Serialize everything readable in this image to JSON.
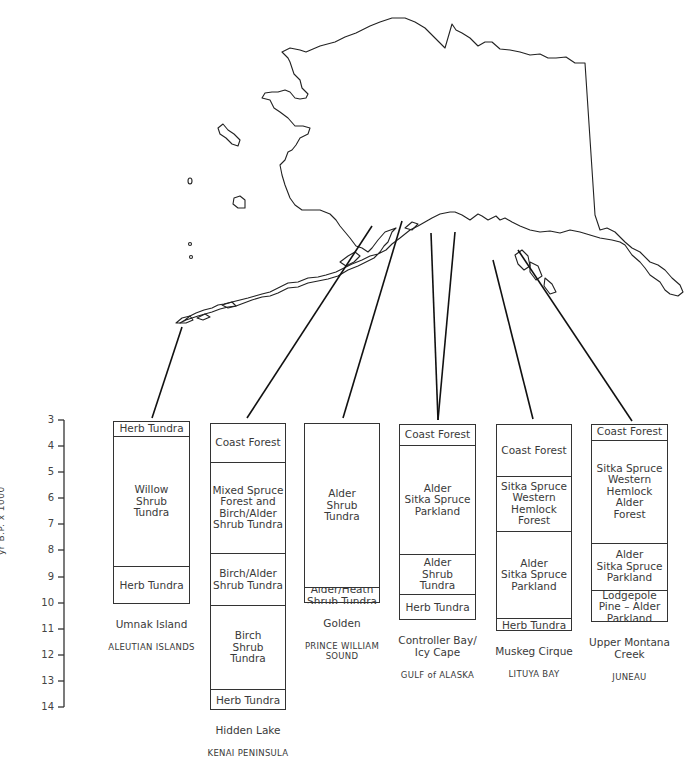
{
  "figure": {
    "type": "vegetation-history-diagram",
    "map_subject": "Alaska outline with lines linking core sites to pollen-zone columns"
  },
  "axis": {
    "label": "yr B.P. x 1000",
    "ticks": [
      "3",
      "4",
      "5",
      "6",
      "7",
      "8",
      "9",
      "10",
      "11",
      "12",
      "13",
      "14"
    ]
  },
  "columns": [
    {
      "site": "Umnak Island",
      "region": "ALEUTIAN ISLANDS",
      "zones": [
        {
          "label": "Herb Tundra",
          "from": 3.05,
          "to": 3.6
        },
        {
          "label": "Willow\nShrub\nTundra",
          "from": 3.6,
          "to": 8.6
        },
        {
          "label": "Herb Tundra",
          "from": 8.6,
          "to": 10.05
        }
      ]
    },
    {
      "site": "Hidden Lake",
      "region": "KENAI PENINSULA",
      "zones": [
        {
          "label": "Coast Forest",
          "from": 3.1,
          "to": 4.6
        },
        {
          "label": "Mixed Spruce\nForest and\nBirch/Alder\nShrub Tundra",
          "from": 4.6,
          "to": 8.1
        },
        {
          "label": "Birch/Alder\nShrub Tundra",
          "from": 8.1,
          "to": 10.1
        },
        {
          "label": "Birch\nShrub\nTundra",
          "from": 10.1,
          "to": 13.3
        },
        {
          "label": "Herb Tundra",
          "from": 13.3,
          "to": 14.1
        }
      ]
    },
    {
      "site": "Golden",
      "region": "PRINCE WILLIAM\nSOUND",
      "zones": [
        {
          "label": "Alder\nShrub\nTundra",
          "from": 3.1,
          "to": 9.4
        },
        {
          "label": "Alder/Heath\nShrub Tundra",
          "from": 9.4,
          "to": 10.0
        }
      ]
    },
    {
      "site": "Controller Bay/\nIcy Cape",
      "region": "GULF of ALASKA",
      "zones": [
        {
          "label": "Coast Forest",
          "from": 3.15,
          "to": 3.95
        },
        {
          "label": "Alder\nSitka Spruce\nParkland",
          "from": 3.95,
          "to": 8.15
        },
        {
          "label": "Alder\nShrub\nTundra",
          "from": 8.15,
          "to": 9.65
        },
        {
          "label": "Herb Tundra",
          "from": 9.65,
          "to": 10.65
        }
      ]
    },
    {
      "site": "Muskeg Cirque",
      "region": "LITUYA BAY",
      "zones": [
        {
          "label": "Coast Forest",
          "from": 3.15,
          "to": 5.15
        },
        {
          "label": "Sitka Spruce\nWestern\nHemlock\nForest",
          "from": 5.15,
          "to": 7.25
        },
        {
          "label": "Alder\nSitka Spruce\nParkland",
          "from": 7.25,
          "to": 10.6
        },
        {
          "label": "Herb Tundra",
          "from": 10.6,
          "to": 11.1
        }
      ]
    },
    {
      "site": "Upper Montana\nCreek",
      "region": "JUNEAU",
      "zones": [
        {
          "label": "Coast Forest",
          "from": 3.15,
          "to": 3.75
        },
        {
          "label": "Sitka Spruce\nWestern\nHemlock\nAlder\nForest",
          "from": 3.75,
          "to": 7.7
        },
        {
          "label": "Alder\nSitka Spruce\nParkland",
          "from": 7.7,
          "to": 9.5
        },
        {
          "label": "Lodgepole\nPine – Alder\nParkland",
          "from": 9.5,
          "to": 10.75
        }
      ]
    }
  ],
  "colors": {
    "line": "#222222",
    "text": "#3a3a3a",
    "background": "#ffffff"
  }
}
